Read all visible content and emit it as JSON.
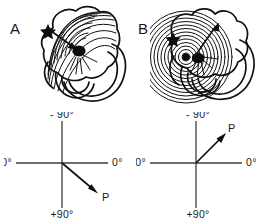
{
  "figure": {
    "panels": [
      {
        "letter": "A",
        "diagram_type": "cardiac-activation-map",
        "pattern": "arc-shaped isochrones spreading from pacing site",
        "markers": {
          "star_label": "pacing site",
          "dot_label": "earliest activation focus",
          "arrow_label": "activation propagation direction"
        },
        "axis": {
          "top": "- 90°",
          "right": "0°",
          "left": "±180°",
          "bottom": "+90°",
          "vector_label": "P",
          "vector_angle_deg": 40,
          "vector_direction": "down-right"
        }
      },
      {
        "letter": "B",
        "diagram_type": "cardiac-activation-map",
        "pattern": "concentric circular isochrones around focal origin",
        "markers": {
          "star_label": "pacing site",
          "dot_label": "earliest activation focus",
          "arrow_label": "activation propagation direction"
        },
        "axis": {
          "top": "- 90°",
          "right": "0°",
          "left": "±180°",
          "bottom": "+90°",
          "vector_label": "P",
          "vector_angle_deg": -45,
          "vector_direction": "up-right"
        }
      }
    ],
    "colors": {
      "background": "#ffffff",
      "ink": "#111111",
      "axis": "#3d3d3d"
    }
  }
}
